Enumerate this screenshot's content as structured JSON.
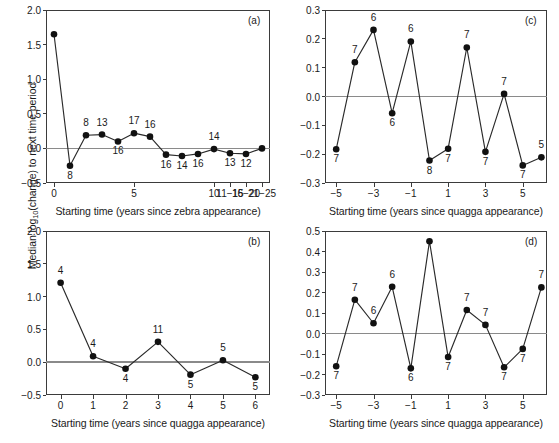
{
  "figure": {
    "y_axis_label_prefix": "Median log",
    "y_axis_label_sub": "10",
    "y_axis_label_suffix": "(change) to next time period"
  },
  "chart_data": [
    {
      "type": "line",
      "panel": "(a)",
      "title": "",
      "xlabel": "Starting time (years since zebra appearance)",
      "ylabel": "Median log10(change) to next time period",
      "ylim": [
        -0.5,
        2.0
      ],
      "yticks": [
        "2.0",
        "1.5",
        "1.0",
        "0.5",
        "0.0",
        "-0.5"
      ],
      "ytickvalues": [
        2.0,
        1.5,
        1.0,
        0.5,
        0.0,
        -0.5
      ],
      "xtick_labels": [
        "0",
        "5",
        "10",
        "11-15",
        "16-20",
        "21-25"
      ],
      "xtick_indices": [
        0,
        5,
        10,
        11,
        12,
        13
      ],
      "grid": false,
      "zero_reference_line": true,
      "categories": [
        "0",
        "1",
        "2",
        "3",
        "4",
        "5",
        "6",
        "7",
        "8",
        "9",
        "10",
        "11-15",
        "16-20",
        "21-25"
      ],
      "values": [
        1.65,
        -0.25,
        0.19,
        0.2,
        0.1,
        0.22,
        0.17,
        -0.09,
        -0.11,
        -0.08,
        -0.01,
        -0.07,
        -0.08,
        0.0
      ],
      "point_labels": [
        "",
        "8",
        "8",
        "13",
        "16",
        "17",
        "16",
        "16",
        "14",
        "16",
        "14",
        "13",
        "12",
        ""
      ],
      "point_label_positions": [
        "",
        "below",
        "above",
        "above",
        "below",
        "above",
        "above",
        "below",
        "below",
        "below",
        "above",
        "below",
        "below",
        ""
      ]
    },
    {
      "type": "line",
      "panel": "(c)",
      "title": "",
      "xlabel": "Starting time (years since quagga appearance)",
      "ylabel": "Median log10(change) to next time period",
      "ylim": [
        -0.3,
        0.3
      ],
      "yticks": [
        "0.3",
        "0.2",
        "0.1",
        "0.0",
        "-0.1",
        "-0.2",
        "-0.3"
      ],
      "ytickvalues": [
        0.3,
        0.2,
        0.1,
        0.0,
        -0.1,
        -0.2,
        -0.3
      ],
      "xtick_labels": [
        "-5",
        "-3",
        "-1",
        "1",
        "3",
        "5"
      ],
      "xtickvalues": [
        -5,
        -3,
        -1,
        1,
        3,
        5
      ],
      "xlim": [
        -5.6,
        6.3
      ],
      "grid": false,
      "zero_reference_line": true,
      "x": [
        -5,
        -4,
        -3,
        -2,
        -1,
        0,
        1,
        2,
        3,
        4,
        5,
        6
      ],
      "values": [
        -0.183,
        0.119,
        0.231,
        -0.058,
        0.191,
        -0.222,
        -0.181,
        0.17,
        -0.192,
        0.009,
        -0.239,
        -0.211
      ],
      "point_labels": [
        "7",
        "7",
        "6",
        "6",
        "6",
        "8",
        "7",
        "7",
        "7",
        "7",
        "7",
        "5"
      ],
      "point_label_positions": [
        "below",
        "above",
        "above",
        "below",
        "above",
        "below",
        "below",
        "above",
        "below",
        "above",
        "below",
        "above"
      ]
    },
    {
      "type": "line",
      "panel": "(b)",
      "title": "",
      "xlabel": "Starting time (years since quagga appearance)",
      "ylabel": "Median log10(change) to next time period",
      "ylim": [
        -0.5,
        2.0
      ],
      "yticks": [
        "2.0",
        "1.5",
        "1.0",
        "0.5",
        "0.0",
        "-0.5"
      ],
      "ytickvalues": [
        2.0,
        1.5,
        1.0,
        0.5,
        0.0,
        -0.5
      ],
      "xtick_labels": [
        "0",
        "1",
        "2",
        "3",
        "4",
        "5",
        "6"
      ],
      "xtickvalues": [
        0,
        1,
        2,
        3,
        4,
        5,
        6
      ],
      "xlim": [
        -0.45,
        6.45
      ],
      "grid": false,
      "zero_reference_line": true,
      "x": [
        0,
        1,
        2,
        3,
        4,
        5,
        6
      ],
      "values": [
        1.21,
        0.09,
        -0.1,
        0.31,
        -0.19,
        0.03,
        -0.23
      ],
      "point_labels": [
        "4",
        "4",
        "4",
        "11",
        "5",
        "5",
        "5"
      ],
      "point_label_positions": [
        "above",
        "above",
        "below",
        "above",
        "below",
        "above",
        "below"
      ]
    },
    {
      "type": "line",
      "panel": "(d)",
      "title": "",
      "xlabel": "Starting time (years since quagga appearance)",
      "ylabel": "Median log10(change) to next time period",
      "ylim": [
        -0.3,
        0.5
      ],
      "yticks": [
        "0.5",
        "0.4",
        "0.3",
        "0.2",
        "0.1",
        "0.0",
        "-0.1",
        "-0.2",
        "-0.3"
      ],
      "ytickvalues": [
        0.5,
        0.4,
        0.3,
        0.2,
        0.1,
        0.0,
        -0.1,
        -0.2,
        -0.3
      ],
      "xtick_labels": [
        "-5",
        "-3",
        "-1",
        "1",
        "3",
        "5"
      ],
      "xtickvalues": [
        -5,
        -3,
        -1,
        1,
        3,
        5
      ],
      "xlim": [
        -5.6,
        6.3
      ],
      "grid": false,
      "zero_reference_line": true,
      "x": [
        -5,
        -4,
        -3,
        -2,
        -1,
        0,
        1,
        2,
        3,
        4,
        5,
        6
      ],
      "values": [
        -0.16,
        0.165,
        0.05,
        0.228,
        -0.17,
        0.45,
        -0.115,
        0.115,
        0.042,
        -0.165,
        -0.075,
        0.225
      ],
      "point_labels": [
        "7",
        "7",
        "6",
        "6",
        "6",
        "",
        "7",
        "7",
        "7",
        "7",
        "7",
        "7"
      ],
      "point_label_positions": [
        "below",
        "above",
        "above",
        "above",
        "below",
        "",
        "below",
        "above",
        "above",
        "below",
        "below",
        "above"
      ]
    }
  ]
}
